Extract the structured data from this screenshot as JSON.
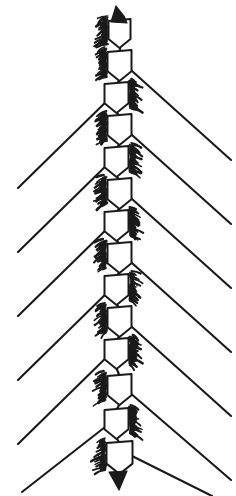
{
  "canvas": {
    "width": 236,
    "height": 496,
    "background_color": "#fefefe",
    "ink_color": "#1a1a1a",
    "fill_color": "#ffffff"
  },
  "figure": {
    "style": "black-and-white engraving line art",
    "axis_x": 118,
    "axis_top_y": 16,
    "axis_bottom_y": 488,
    "chevron_count": 14,
    "ray_count_left": 7,
    "ray_count_right": 7,
    "stroke_width_ray": 2.1,
    "stroke_width_chevron": 2.0
  },
  "chart_data": {
    "type": "scatter",
    "xlabel": "",
    "ylabel": "",
    "xlim": [
      0,
      236
    ],
    "ylim": [
      496,
      0
    ],
    "grid": false,
    "legend": "none",
    "axis_x": 118,
    "chevrons": [
      {
        "index": 1,
        "cy": 34,
        "half_width": 11,
        "depth": 14,
        "tuft_side": "left",
        "ray_side": "none"
      },
      {
        "index": 2,
        "cy": 66,
        "half_width": 12,
        "depth": 15,
        "tuft_side": "left",
        "ray_side": "right"
      },
      {
        "index": 3,
        "cy": 98,
        "half_width": 12,
        "depth": 15,
        "tuft_side": "right",
        "ray_side": "left"
      },
      {
        "index": 4,
        "cy": 130,
        "half_width": 12,
        "depth": 15,
        "tuft_side": "left",
        "ray_side": "right"
      },
      {
        "index": 5,
        "cy": 162,
        "half_width": 12,
        "depth": 15,
        "tuft_side": "right",
        "ray_side": "left"
      },
      {
        "index": 6,
        "cy": 194,
        "half_width": 12,
        "depth": 15,
        "tuft_side": "left",
        "ray_side": "right"
      },
      {
        "index": 7,
        "cy": 226,
        "half_width": 12,
        "depth": 15,
        "tuft_side": "right",
        "ray_side": "left"
      },
      {
        "index": 8,
        "cy": 258,
        "half_width": 12,
        "depth": 15,
        "tuft_side": "left",
        "ray_side": "right"
      },
      {
        "index": 9,
        "cy": 290,
        "half_width": 12,
        "depth": 15,
        "tuft_side": "right",
        "ray_side": "left"
      },
      {
        "index": 10,
        "cy": 322,
        "half_width": 12,
        "depth": 15,
        "tuft_side": "left",
        "ray_side": "right"
      },
      {
        "index": 11,
        "cy": 354,
        "half_width": 12,
        "depth": 15,
        "tuft_side": "right",
        "ray_side": "left"
      },
      {
        "index": 12,
        "cy": 390,
        "half_width": 12,
        "depth": 15,
        "tuft_side": "left",
        "ray_side": "right"
      },
      {
        "index": 13,
        "cy": 424,
        "half_width": 12,
        "depth": 15,
        "tuft_side": "right",
        "ray_side": "left"
      },
      {
        "index": 14,
        "cy": 458,
        "half_width": 13,
        "depth": 16,
        "tuft_side": "left",
        "ray_side": "right"
      }
    ],
    "rays": [
      {
        "index": 1,
        "side": "right",
        "x1": 122,
        "y1": 62,
        "x2": 231,
        "y2": 160
      },
      {
        "index": 2,
        "side": "left",
        "x1": 114,
        "y1": 94,
        "x2": 18,
        "y2": 188
      },
      {
        "index": 3,
        "side": "right",
        "x1": 122,
        "y1": 126,
        "x2": 231,
        "y2": 224
      },
      {
        "index": 4,
        "side": "left",
        "x1": 114,
        "y1": 158,
        "x2": 18,
        "y2": 252
      },
      {
        "index": 5,
        "side": "right",
        "x1": 122,
        "y1": 190,
        "x2": 231,
        "y2": 288
      },
      {
        "index": 6,
        "side": "left",
        "x1": 114,
        "y1": 222,
        "x2": 18,
        "y2": 316
      },
      {
        "index": 7,
        "side": "right",
        "x1": 122,
        "y1": 254,
        "x2": 231,
        "y2": 352
      },
      {
        "index": 8,
        "side": "left",
        "x1": 114,
        "y1": 286,
        "x2": 18,
        "y2": 380
      },
      {
        "index": 9,
        "side": "right",
        "x1": 122,
        "y1": 318,
        "x2": 231,
        "y2": 416
      },
      {
        "index": 10,
        "side": "left",
        "x1": 114,
        "y1": 350,
        "x2": 18,
        "y2": 444
      },
      {
        "index": 11,
        "side": "right",
        "x1": 122,
        "y1": 386,
        "x2": 231,
        "y2": 480
      },
      {
        "index": 12,
        "side": "left",
        "x1": 114,
        "y1": 420,
        "x2": 22,
        "y2": 492
      },
      {
        "index": 13,
        "side": "right",
        "x1": 124,
        "y1": 452,
        "x2": 212,
        "y2": 496
      },
      {
        "index": 14,
        "side": "left",
        "x1": 112,
        "y1": 30,
        "x2": 96,
        "y2": 46
      }
    ]
  }
}
